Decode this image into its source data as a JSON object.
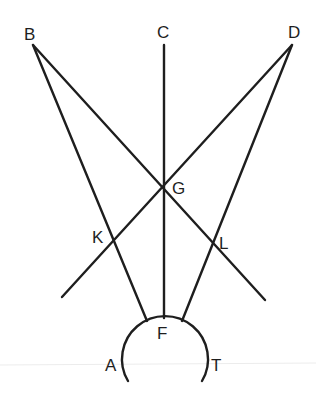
{
  "diagram": {
    "title": "",
    "stroke_color": "#1e1e1e",
    "background": "#ffffff",
    "points": {
      "B": {
        "label": "B",
        "x": 33,
        "y": 45,
        "lx": 24,
        "ly": 40
      },
      "C": {
        "label": "C",
        "x": 164,
        "y": 45,
        "lx": 157,
        "ly": 38
      },
      "D": {
        "label": "D",
        "x": 292,
        "y": 45,
        "lx": 288,
        "ly": 38
      },
      "G": {
        "label": "G",
        "x": 164,
        "y": 187,
        "lx": 172,
        "ly": 194
      },
      "K": {
        "label": "K",
        "x": 113,
        "y": 240,
        "lx": 92,
        "ly": 243
      },
      "L": {
        "label": "L",
        "x": 213,
        "y": 243,
        "lx": 219,
        "ly": 249
      },
      "F": {
        "label": "F",
        "x": 163,
        "y": 318,
        "lx": 157,
        "ly": 339
      },
      "A": {
        "label": "A",
        "lx": 105,
        "ly": 371
      },
      "T": {
        "label": "T",
        "lx": 211,
        "ly": 371
      }
    },
    "lines": [
      {
        "name": "line-B-F",
        "x1": 33,
        "y1": 45,
        "x2": 147,
        "y2": 321
      },
      {
        "name": "line-D-F",
        "x1": 292,
        "y1": 45,
        "x2": 182,
        "y2": 321
      },
      {
        "name": "line-C-F",
        "x1": 164,
        "y1": 45,
        "x2": 164,
        "y2": 318
      },
      {
        "name": "line-B-G-L",
        "x1": 33,
        "y1": 45,
        "x2": 265,
        "y2": 300
      },
      {
        "name": "line-D-G-K",
        "x1": 292,
        "y1": 45,
        "x2": 62,
        "y2": 297
      }
    ],
    "arc": {
      "name": "arc-A-F-T",
      "d": "M 128 381 A 43 43 0 1 1 202 381"
    },
    "baseline": {
      "y": 365
    }
  }
}
